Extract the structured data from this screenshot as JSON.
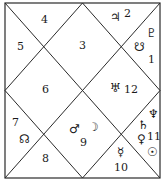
{
  "chart": {
    "type": "north-indian-horoscope",
    "line_color": "#2a2a2a",
    "background": "#ffffff",
    "houses": [
      {
        "sign": "4",
        "planets": []
      },
      {
        "sign": "5",
        "planets": []
      },
      {
        "sign": "3",
        "planets": []
      },
      {
        "sign": "2",
        "planets": [
          "♃"
        ]
      },
      {
        "sign": "1",
        "planets": [
          "♇",
          "☋"
        ]
      },
      {
        "sign": "6",
        "planets": []
      },
      {
        "sign": "12",
        "planets": [
          "♅"
        ]
      },
      {
        "sign": "7",
        "planets": [
          "☊"
        ]
      },
      {
        "sign": "9",
        "planets": [
          "♂",
          "☽"
        ]
      },
      {
        "sign": "8",
        "planets": []
      },
      {
        "sign": "11",
        "planets": [
          "♆",
          "♄",
          "♀",
          "☉"
        ]
      },
      {
        "sign": "10",
        "planets": [
          "☿"
        ]
      }
    ]
  }
}
